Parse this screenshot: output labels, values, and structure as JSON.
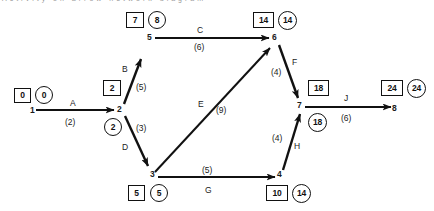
{
  "diagram": {
    "type": "activity-on-arrow-network",
    "title_fragment": "Activity  on  arrow  network  diagram",
    "legend": {
      "box_meaning": "earliest time",
      "circle_meaning": "latest time"
    },
    "nodes": [
      {
        "id": "1",
        "earliest": "0",
        "latest": "0",
        "x": 36,
        "y": 108
      },
      {
        "id": "2",
        "earliest": "2",
        "latest": "2",
        "x": 119,
        "y": 108
      },
      {
        "id": "3",
        "earliest": "5",
        "latest": "5",
        "x": 152,
        "y": 175
      },
      {
        "id": "4",
        "earliest": "10",
        "latest": "14",
        "x": 280,
        "y": 175
      },
      {
        "id": "5",
        "earliest": "7",
        "latest": "8",
        "x": 151,
        "y": 36
      },
      {
        "id": "6",
        "earliest": "14",
        "latest": "14",
        "x": 274,
        "y": 36
      },
      {
        "id": "7",
        "earliest": "18",
        "latest": "18",
        "x": 300,
        "y": 105
      },
      {
        "id": "8",
        "earliest": "24",
        "latest": "24",
        "x": 396,
        "y": 105
      }
    ],
    "edges": [
      {
        "name": "A",
        "duration": "(2)",
        "from": "1",
        "to": "2"
      },
      {
        "name": "B",
        "duration": "(5)",
        "from": "2",
        "to": "5"
      },
      {
        "name": "C",
        "duration": "(6)",
        "from": "5",
        "to": "6"
      },
      {
        "name": "D",
        "duration": "(3)",
        "from": "2",
        "to": "3"
      },
      {
        "name": "E",
        "duration": "(9)",
        "from": "3",
        "to": "6"
      },
      {
        "name": "F",
        "duration": "(4)",
        "from": "6",
        "to": "7"
      },
      {
        "name": "G",
        "duration": "(5)",
        "from": "3",
        "to": "4"
      },
      {
        "name": "H",
        "duration": "(4)",
        "from": "4",
        "to": "7"
      },
      {
        "name": "J",
        "duration": "(6)",
        "from": "7",
        "to": "8"
      }
    ],
    "node_labels": {
      "n1": "1",
      "n2": "2",
      "n3": "3",
      "n4": "4",
      "n5": "5",
      "n6": "6",
      "n7": "7",
      "n8": "8"
    },
    "node_values": {
      "n1_box": "0",
      "n1_circle": "0",
      "n2_box": "2",
      "n2_circle": "2",
      "n3_box": "5",
      "n3_circle": "5",
      "n4_box": "10",
      "n4_circle": "14",
      "n5_box": "7",
      "n5_circle": "8",
      "n6_box": "14",
      "n6_circle": "14",
      "n7_box": "18",
      "n7_circle": "18",
      "n8_box": "24",
      "n8_circle": "24"
    },
    "edge_labels": {
      "a": "A",
      "b": "B",
      "c": "C",
      "d": "D",
      "e": "E",
      "f": "F",
      "g": "G",
      "h": "H",
      "j": "J"
    },
    "edge_durations": {
      "a": "(2)",
      "b": "(5)",
      "c": "(6)",
      "d": "(3)",
      "e": "(9)",
      "f": "(4)",
      "g": "(5)",
      "h": "(4)",
      "j": "(6)"
    },
    "colors": {
      "stroke": "#111111",
      "text": "#1b1b1b",
      "background": "#ffffff"
    }
  }
}
